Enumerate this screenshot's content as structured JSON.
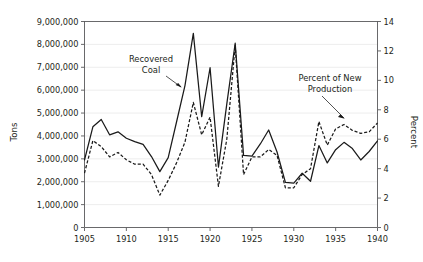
{
  "chart_data": {
    "type": "line",
    "title": "",
    "subtitle": "",
    "xlabel": "",
    "ylabel": "Tons",
    "y2label": "Percent",
    "xlim": [
      1905,
      1940
    ],
    "ylim": [
      0,
      9000000
    ],
    "y2lim": [
      0,
      14
    ],
    "grid": "horizontal",
    "legend": "annotations",
    "x": [
      1905,
      1906,
      1907,
      1908,
      1909,
      1910,
      1911,
      1912,
      1913,
      1914,
      1915,
      1916,
      1917,
      1918,
      1919,
      1920,
      1921,
      1922,
      1923,
      1924,
      1925,
      1926,
      1927,
      1928,
      1929,
      1930,
      1931,
      1932,
      1933,
      1934,
      1935,
      1936,
      1937,
      1938,
      1939,
      1940
    ],
    "xticks": [
      1905,
      1910,
      1915,
      1920,
      1925,
      1930,
      1935,
      1940
    ],
    "xtick_labels": [
      "1905",
      "1910",
      "1915",
      "1920",
      "1925",
      "1930",
      "1935",
      "1940"
    ],
    "yticks": [
      0,
      1000000,
      2000000,
      3000000,
      4000000,
      5000000,
      6000000,
      7000000,
      8000000,
      9000000
    ],
    "ytick_labels": [
      "0",
      "1,000,000",
      "2,000,000",
      "3,000,000",
      "4,000,000",
      "5,000,000",
      "6,000,000",
      "7,000,000",
      "8,000,000",
      "9,000,000"
    ],
    "y2ticks": [
      0,
      2,
      4,
      6,
      8,
      10,
      12,
      14
    ],
    "y2tick_labels": [
      "0",
      "2",
      "4",
      "6",
      "8",
      "10",
      "12",
      "14"
    ],
    "series": [
      {
        "name": "Recovered Coal",
        "axis": "left",
        "style": "solid",
        "unit": "tons",
        "values": [
          2950000,
          4400000,
          4720000,
          4050000,
          4180000,
          3900000,
          3750000,
          3630000,
          3100000,
          2440000,
          3050000,
          4620000,
          6200000,
          8480000,
          4840000,
          6980000,
          2640000,
          5400000,
          8050000,
          3150000,
          3120000,
          3650000,
          4260000,
          3300000,
          1970000,
          1940000,
          2370000,
          2020000,
          3580000,
          2820000,
          3400000,
          3720000,
          3450000,
          2950000,
          3320000,
          3780000
        ]
      },
      {
        "name": "Percent of New Production",
        "axis": "right",
        "style": "dashed",
        "unit": "percent",
        "values": [
          3.7,
          5.9,
          5.5,
          4.8,
          5.1,
          4.6,
          4.3,
          4.3,
          3.6,
          2.2,
          3.2,
          4.4,
          5.8,
          8.5,
          6.3,
          7.5,
          2.8,
          6.0,
          12.4,
          3.6,
          4.8,
          4.8,
          5.3,
          4.9,
          2.7,
          2.7,
          3.6,
          4.0,
          7.2,
          5.6,
          6.7,
          7.0,
          6.6,
          6.4,
          6.5,
          7.1
        ]
      }
    ],
    "annotations": [
      {
        "text_line1": "Recovered",
        "text_line2": "Coal",
        "target_series": "Recovered Coal",
        "arrow": "down-right"
      },
      {
        "text_line1": "Percent of New",
        "text_line2": "Production",
        "target_series": "Percent of New Production",
        "arrow": "down-right"
      }
    ],
    "colors": {
      "series_line": "#1a1a1a",
      "gridline": "#e8e8e8",
      "axis": "#58585a",
      "text": "#231f20",
      "background": "#ffffff"
    }
  }
}
